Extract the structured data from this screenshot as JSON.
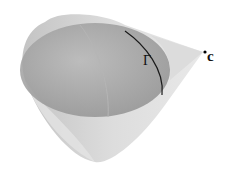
{
  "figure": {
    "labels": {
      "curve": "Γ",
      "apex": "c"
    },
    "colors": {
      "cone_fill": "#cfcfcf",
      "ellipsoid_fill": "#9e9e9e",
      "curve_stroke": "#1a1a1a",
      "apex_point": "#000000"
    }
  }
}
